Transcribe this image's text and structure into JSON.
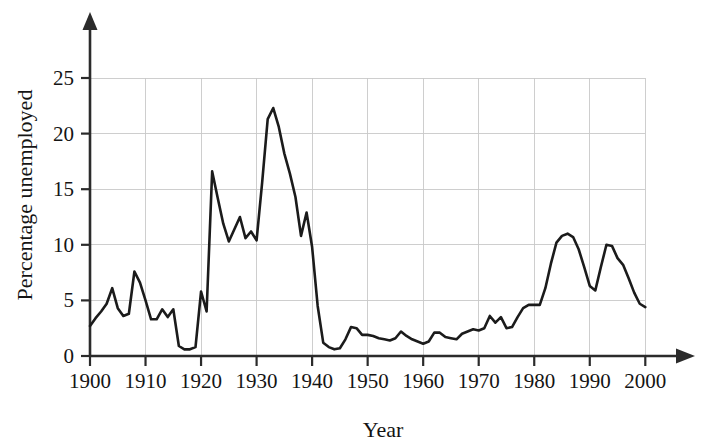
{
  "chart_data": {
    "type": "line",
    "title": "",
    "subtitle": "",
    "xlabel": "Year",
    "ylabel": "Percentage unemployed",
    "xlim": [
      1898,
      2002
    ],
    "ylim": [
      0,
      27
    ],
    "xticks": [
      1900,
      1910,
      1920,
      1930,
      1940,
      1950,
      1960,
      1970,
      1980,
      1990,
      2000
    ],
    "xtick_labels": [
      "1900",
      "1910",
      "1920",
      "1930",
      "1940",
      "1950",
      "1960",
      "1970",
      "1980",
      "1990",
      "2000"
    ],
    "yticks": [
      0,
      5,
      10,
      15,
      20,
      25
    ],
    "ytick_labels": [
      "0",
      "5",
      "10",
      "15",
      "20",
      "25"
    ],
    "grid": true,
    "grid_color": "#c9c9c9",
    "legend": null,
    "line_color": "#1b1b1b",
    "series": [
      {
        "name": "Percentage unemployed",
        "x": [
          1900,
          1901,
          1902,
          1903,
          1904,
          1905,
          1906,
          1907,
          1908,
          1909,
          1910,
          1911,
          1912,
          1913,
          1914,
          1915,
          1916,
          1917,
          1918,
          1919,
          1920,
          1921,
          1922,
          1923,
          1924,
          1925,
          1926,
          1927,
          1928,
          1929,
          1930,
          1931,
          1932,
          1933,
          1934,
          1935,
          1936,
          1937,
          1938,
          1939,
          1940,
          1941,
          1942,
          1943,
          1944,
          1945,
          1946,
          1947,
          1948,
          1949,
          1950,
          1951,
          1952,
          1953,
          1954,
          1955,
          1956,
          1957,
          1958,
          1959,
          1960,
          1961,
          1962,
          1963,
          1964,
          1965,
          1966,
          1967,
          1968,
          1969,
          1970,
          1971,
          1972,
          1973,
          1974,
          1975,
          1976,
          1977,
          1978,
          1979,
          1980,
          1981,
          1982,
          1983,
          1984,
          1985,
          1986,
          1987,
          1988,
          1989,
          1990,
          1991,
          1992,
          1993,
          1994,
          1995,
          1996,
          1997,
          1998,
          1999,
          2000
        ],
        "y": [
          2.7,
          3.4,
          4.0,
          4.7,
          6.1,
          4.3,
          3.6,
          3.8,
          7.6,
          6.6,
          5.0,
          3.3,
          3.3,
          4.2,
          3.5,
          4.2,
          0.9,
          0.6,
          0.6,
          0.8,
          5.8,
          4.0,
          16.6,
          14.2,
          11.9,
          10.3,
          11.4,
          12.5,
          10.6,
          11.2,
          10.4,
          15.6,
          21.3,
          22.3,
          20.6,
          18.2,
          16.4,
          14.3,
          10.8,
          12.9,
          9.8,
          4.5,
          1.2,
          0.8,
          0.6,
          0.7,
          1.5,
          2.6,
          2.5,
          1.9,
          1.9,
          1.8,
          1.6,
          1.5,
          1.4,
          1.6,
          2.2,
          1.8,
          1.5,
          1.3,
          1.1,
          1.3,
          2.1,
          2.1,
          1.7,
          1.6,
          1.5,
          2.0,
          2.2,
          2.4,
          2.3,
          2.5,
          3.6,
          3.0,
          3.5,
          2.5,
          2.6,
          3.5,
          4.3,
          4.6,
          4.6,
          4.6,
          6.1,
          8.3,
          10.2,
          10.8,
          11.0,
          10.7,
          9.6,
          8.0,
          6.3,
          5.9,
          8.0,
          10.0,
          9.9,
          8.8,
          8.2,
          7.0,
          5.7,
          4.7,
          4.4
        ]
      }
    ],
    "annotations": [],
    "notable_points": [
      {
        "label": "peak 1908",
        "x": 1908,
        "y": 7.6
      },
      {
        "label": "trough 1918",
        "x": 1918,
        "y": 0.6
      },
      {
        "label": "spike 1921",
        "x": 1921,
        "y": 16.6
      },
      {
        "label": "great-depression-peak 1932",
        "x": 1932,
        "y": 22.3
      },
      {
        "label": "wartime-trough 1944",
        "x": 1944,
        "y": 0.6
      },
      {
        "label": "peak 1986",
        "x": 1986,
        "y": 11.0
      },
      {
        "label": "dip 1990",
        "x": 1990,
        "y": 6.3
      },
      {
        "label": "peak 1993",
        "x": 1993,
        "y": 10.0
      },
      {
        "label": "end 2000",
        "x": 2000,
        "y": 4.4
      }
    ]
  },
  "figure": {
    "background_color": "#ffffff",
    "axis_color": "#2b2b2b"
  }
}
